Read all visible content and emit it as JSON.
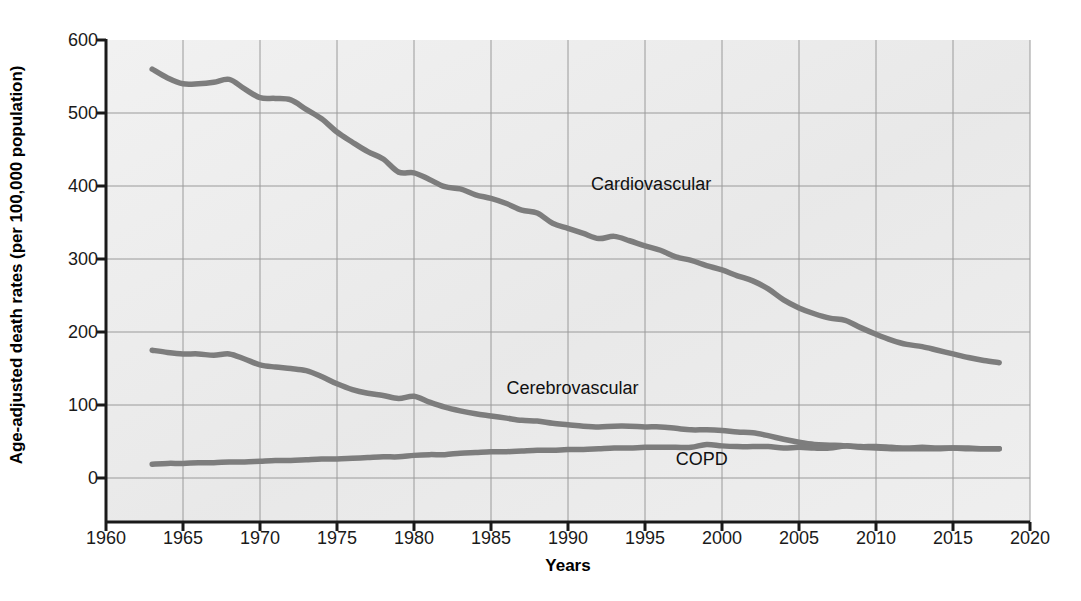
{
  "chart_data": {
    "type": "line",
    "title": "",
    "xlabel": "Years",
    "ylabel": "Age-adjusted death rates (per 100,000 population)",
    "xlim": [
      1960,
      2020
    ],
    "ylim": [
      0,
      600
    ],
    "xticks": [
      1960,
      1965,
      1970,
      1975,
      1980,
      1985,
      1990,
      1995,
      2000,
      2005,
      2010,
      2015,
      2020
    ],
    "yticks": [
      0,
      100,
      200,
      300,
      400,
      500,
      600
    ],
    "grid": true,
    "legend_position": "inline-annotations",
    "line_color": "#7d7d7d",
    "plot_background": "#ececec",
    "series": [
      {
        "name": "Cardiovascular",
        "label_x": 1991.5,
        "label_y": 400,
        "x": [
          1963,
          1964,
          1965,
          1966,
          1967,
          1968,
          1969,
          1970,
          1971,
          1972,
          1973,
          1974,
          1975,
          1976,
          1977,
          1978,
          1979,
          1980,
          1981,
          1982,
          1983,
          1984,
          1985,
          1986,
          1987,
          1988,
          1989,
          1990,
          1991,
          1992,
          1993,
          1994,
          1995,
          1996,
          1997,
          1998,
          1999,
          2000,
          2001,
          2002,
          2003,
          2004,
          2005,
          2006,
          2007,
          2008,
          2009,
          2010,
          2011,
          2012,
          2013,
          2014,
          2015,
          2016,
          2017,
          2018
        ],
        "y": [
          560,
          548,
          540,
          540,
          542,
          546,
          533,
          521,
          520,
          518,
          505,
          492,
          474,
          460,
          447,
          437,
          419,
          418,
          409,
          399,
          396,
          388,
          383,
          376,
          367,
          363,
          349,
          342,
          335,
          328,
          331,
          325,
          318,
          312,
          303,
          298,
          291,
          285,
          277,
          270,
          259,
          244,
          233,
          225,
          219,
          216,
          206,
          197,
          189,
          183,
          180,
          175,
          170,
          165,
          161,
          158
        ]
      },
      {
        "name": "Cerebrovascular",
        "label_x": 1986,
        "label_y": 120,
        "x": [
          1963,
          1964,
          1965,
          1966,
          1967,
          1968,
          1969,
          1970,
          1971,
          1972,
          1973,
          1974,
          1975,
          1976,
          1977,
          1978,
          1979,
          1980,
          1981,
          1982,
          1983,
          1984,
          1985,
          1986,
          1987,
          1988,
          1989,
          1990,
          1991,
          1992,
          1993,
          1994,
          1995,
          1996,
          1997,
          1998,
          1999,
          2000,
          2001,
          2002,
          2003,
          2004,
          2005,
          2006,
          2007,
          2008,
          2009,
          2010,
          2011,
          2012,
          2013,
          2014,
          2015,
          2016,
          2017,
          2018
        ],
        "y": [
          175,
          172,
          170,
          170,
          168,
          170,
          163,
          155,
          152,
          150,
          147,
          139,
          129,
          121,
          116,
          113,
          109,
          112,
          104,
          97,
          92,
          88,
          85,
          82,
          79,
          78,
          75,
          73,
          71,
          70,
          71,
          71,
          70,
          70,
          68,
          66,
          66,
          65,
          63,
          62,
          58,
          53,
          49,
          46,
          45,
          44,
          42,
          41,
          40,
          40,
          40,
          40,
          41,
          40,
          40,
          40
        ]
      },
      {
        "name": "COPD",
        "label_x": 1997,
        "label_y": 23,
        "x": [
          1963,
          1964,
          1965,
          1966,
          1967,
          1968,
          1969,
          1970,
          1971,
          1972,
          1973,
          1974,
          1975,
          1976,
          1977,
          1978,
          1979,
          1980,
          1981,
          1982,
          1983,
          1984,
          1985,
          1986,
          1987,
          1988,
          1989,
          1990,
          1991,
          1992,
          1993,
          1994,
          1995,
          1996,
          1997,
          1998,
          1999,
          2000,
          2001,
          2002,
          2003,
          2004,
          2005,
          2006,
          2007,
          2008,
          2009,
          2010,
          2011,
          2012,
          2013,
          2014,
          2015,
          2016,
          2017,
          2018
        ],
        "y": [
          19,
          20,
          20,
          21,
          21,
          22,
          22,
          23,
          24,
          24,
          25,
          26,
          26,
          27,
          28,
          29,
          29,
          31,
          32,
          32,
          34,
          35,
          36,
          36,
          37,
          38,
          38,
          39,
          39,
          40,
          41,
          41,
          42,
          42,
          42,
          42,
          46,
          44,
          43,
          43,
          43,
          41,
          42,
          41,
          41,
          44,
          43,
          43,
          42,
          41,
          42,
          41,
          41,
          41,
          40,
          40
        ]
      }
    ]
  },
  "axis": {
    "x_tick_labels": [
      "1960",
      "1965",
      "1970",
      "1975",
      "1980",
      "1985",
      "1990",
      "1995",
      "2000",
      "2005",
      "2010",
      "2015",
      "2020"
    ],
    "y_tick_labels": [
      "600",
      "500",
      "400",
      "300",
      "200",
      "100",
      "0"
    ],
    "x_axis_title": "Years",
    "y_axis_title": "Age-adjusted death rates (per 100,000 population)"
  },
  "annotations": {
    "cardiovascular": "Cardiovascular",
    "cerebrovascular": "Cerebrovascular",
    "copd": "COPD"
  }
}
